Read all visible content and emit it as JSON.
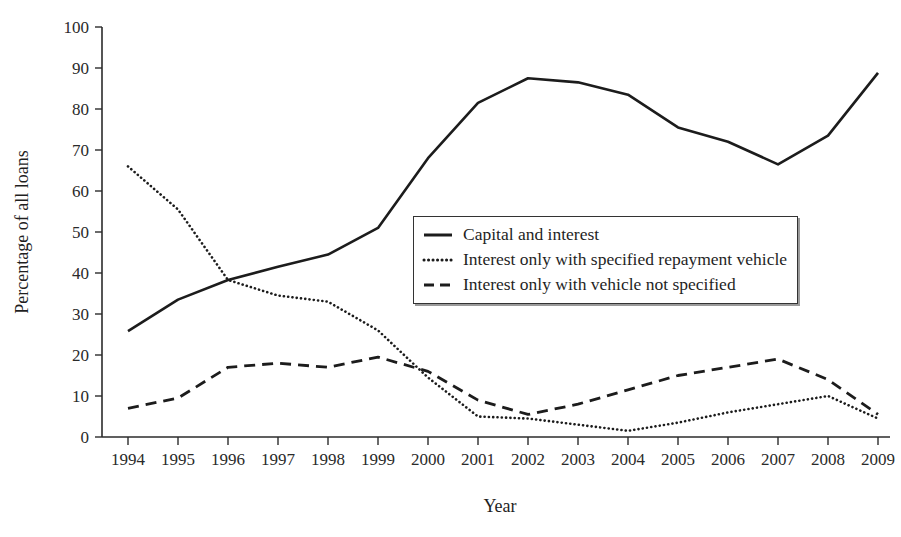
{
  "chart_data": {
    "type": "line",
    "title": "",
    "xlabel": "Year",
    "ylabel": "Percentage of all loans",
    "categories": [
      "1994",
      "1995",
      "1996",
      "1997",
      "1998",
      "1999",
      "2000",
      "2001",
      "2002",
      "2003",
      "2004",
      "2005",
      "2006",
      "2007",
      "2008",
      "2009"
    ],
    "x": [
      1994,
      1995,
      1996,
      1997,
      1998,
      1999,
      2000,
      2001,
      2002,
      2003,
      2004,
      2005,
      2006,
      2007,
      2008,
      2009
    ],
    "xlim": [
      1994,
      2009
    ],
    "ylim": [
      0,
      100
    ],
    "yticks": [
      0,
      10,
      20,
      30,
      40,
      50,
      60,
      70,
      80,
      90,
      100
    ],
    "grid": false,
    "legend_position": "center-right",
    "series": [
      {
        "name": "Capital and interest",
        "style": "solid",
        "values": [
          25.8,
          33.5,
          38.3,
          41.5,
          44.5,
          51.0,
          68.0,
          81.5,
          87.5,
          86.5,
          83.5,
          75.5,
          72.0,
          66.5,
          73.5,
          88.8
        ]
      },
      {
        "name": "Interest only with specified repayment vehicle",
        "style": "dotted",
        "values": [
          66.0,
          55.5,
          38.3,
          34.5,
          33.0,
          26.0,
          14.5,
          5.0,
          4.5,
          3.0,
          1.5,
          3.5,
          6.0,
          8.0,
          10.0,
          4.5
        ]
      },
      {
        "name": "Interest only with vehicle not specified",
        "style": "dashed",
        "values": [
          7.0,
          9.5,
          17.0,
          18.0,
          17.0,
          19.5,
          16.0,
          9.0,
          5.5,
          8.0,
          11.5,
          15.0,
          17.0,
          19.0,
          14.0,
          5.5
        ]
      }
    ]
  },
  "legend": {
    "items": [
      {
        "label": "Capital and interest",
        "style": "solid"
      },
      {
        "label": "Interest only with specified repayment vehicle",
        "style": "dotted"
      },
      {
        "label": "Interest only with vehicle not specified",
        "style": "dashed"
      }
    ]
  },
  "axes": {
    "y_title": "Percentage of all loans",
    "x_title": "Year"
  }
}
